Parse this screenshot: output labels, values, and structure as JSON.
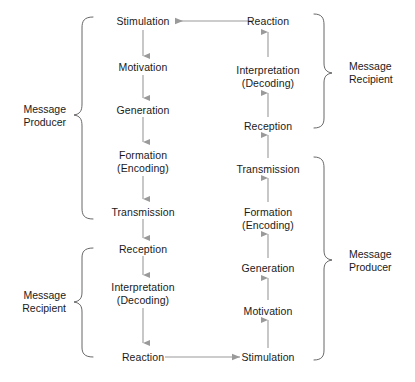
{
  "diagram": {
    "colors": {
      "arrow": "#9a9a9a",
      "brace": "#555555",
      "text": "#1a1a1a",
      "background": "#ffffff"
    },
    "left_column": [
      {
        "id": "l1",
        "line1": "Stimulation",
        "line2": ""
      },
      {
        "id": "l2",
        "line1": "Motivation",
        "line2": ""
      },
      {
        "id": "l3",
        "line1": "Generation",
        "line2": ""
      },
      {
        "id": "l4",
        "line1": "Formation",
        "line2": "(Encoding)"
      },
      {
        "id": "l5",
        "line1": "Transmission",
        "line2": ""
      },
      {
        "id": "l6",
        "line1": "Reception",
        "line2": ""
      },
      {
        "id": "l7",
        "line1": "Interpretation",
        "line2": "(Decoding)"
      },
      {
        "id": "l8",
        "line1": "Reaction",
        "line2": ""
      }
    ],
    "right_column": [
      {
        "id": "r1",
        "line1": "Reaction",
        "line2": ""
      },
      {
        "id": "r2",
        "line1": "Interpretation",
        "line2": "(Decoding)"
      },
      {
        "id": "r3",
        "line1": "Reception",
        "line2": ""
      },
      {
        "id": "r4",
        "line1": "Transmission",
        "line2": ""
      },
      {
        "id": "r5",
        "line1": "Formation",
        "line2": "(Encoding)"
      },
      {
        "id": "r6",
        "line1": "Generation",
        "line2": ""
      },
      {
        "id": "r7",
        "line1": "Motivation",
        "line2": ""
      },
      {
        "id": "r8",
        "line1": "Stimulation",
        "line2": ""
      }
    ],
    "groups": [
      {
        "id": "g-left-top",
        "line1": "Message",
        "line2": "Producer",
        "side": "left"
      },
      {
        "id": "g-left-bottom",
        "line1": "Message",
        "line2": "Recipient",
        "side": "left"
      },
      {
        "id": "g-right-top",
        "line1": "Message",
        "line2": "Recipient",
        "side": "right"
      },
      {
        "id": "g-right-bottom",
        "line1": "Message",
        "line2": "Producer",
        "side": "right"
      }
    ]
  }
}
